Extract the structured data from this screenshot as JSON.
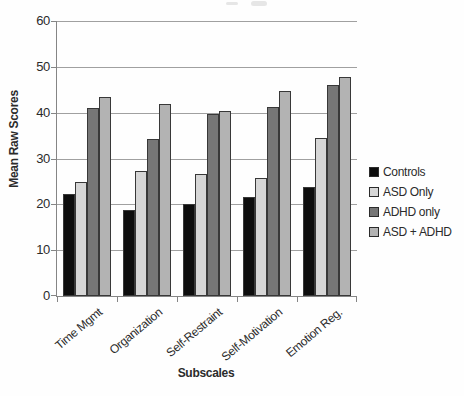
{
  "style": {
    "text_color": "#2b2b2b",
    "grid_color": "#a0a0a0",
    "axis_color": "#858585",
    "bar_border_color": "#383838",
    "background": "#fefefe"
  },
  "chart_data": {
    "type": "bar",
    "title": "",
    "xlabel": "Subscales",
    "ylabel": "Mean Raw Scores",
    "ylim": [
      0,
      60
    ],
    "yticks": [
      0,
      10,
      20,
      30,
      40,
      50,
      60
    ],
    "grid": "horizontal",
    "legend_position": "right",
    "categories": [
      "Time Mgmt",
      "Organization",
      "Self-Restraint",
      "Self-Motivation",
      "Emotion Reg."
    ],
    "series": [
      {
        "name": "Controls",
        "color": "#0d0d0d",
        "values": [
          22.2,
          18.8,
          20.1,
          21.5,
          23.8
        ]
      },
      {
        "name": "ASD Only",
        "color": "#d6d6d6",
        "values": [
          24.9,
          27.3,
          26.7,
          25.8,
          34.4
        ]
      },
      {
        "name": "ADHD only",
        "color": "#767676",
        "values": [
          41.0,
          34.3,
          39.8,
          41.2,
          46.0
        ]
      },
      {
        "name": "ASD + ADHD",
        "color": "#b3b3b3",
        "values": [
          43.4,
          41.8,
          40.4,
          44.8,
          47.7
        ]
      }
    ]
  }
}
